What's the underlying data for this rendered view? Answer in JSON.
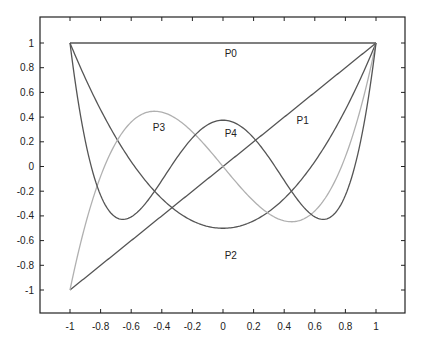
{
  "chart_data": {
    "type": "line",
    "title": "",
    "xlabel": "",
    "ylabel": "",
    "xlim": [
      -1.2,
      1.2
    ],
    "ylim": [
      -1.2,
      1.2
    ],
    "grid": false,
    "legend": "none (curves labeled inline)",
    "x_ticks": [
      "-1",
      "-0.8",
      "-0.6",
      "-0.4",
      "-0.2",
      "0",
      "0.2",
      "0.4",
      "0.6",
      "0.8",
      "1"
    ],
    "y_ticks": [
      "1",
      "0.8",
      "0.6",
      "0.4",
      "0.2",
      "0",
      "-0.2",
      "-0.4",
      "-0.6",
      "-0.8",
      "-1"
    ],
    "x": [
      -1,
      -0.9,
      -0.8,
      -0.7,
      -0.6,
      -0.5,
      -0.4,
      -0.3,
      -0.2,
      -0.1,
      0,
      0.1,
      0.2,
      0.3,
      0.4,
      0.5,
      0.6,
      0.7,
      0.8,
      0.9,
      1
    ],
    "series": [
      {
        "name": "P0",
        "color": "#555555",
        "values": [
          1,
          1,
          1,
          1,
          1,
          1,
          1,
          1,
          1,
          1,
          1,
          1,
          1,
          1,
          1,
          1,
          1,
          1,
          1,
          1,
          1
        ]
      },
      {
        "name": "P1",
        "color": "#555555",
        "values": [
          -1,
          -0.9,
          -0.8,
          -0.7,
          -0.6,
          -0.5,
          -0.4,
          -0.3,
          -0.2,
          -0.1,
          0,
          0.1,
          0.2,
          0.3,
          0.4,
          0.5,
          0.6,
          0.7,
          0.8,
          0.9,
          1
        ]
      },
      {
        "name": "P2",
        "color": "#555555",
        "values": [
          1,
          0.715,
          0.46,
          0.235,
          0.04,
          -0.125,
          -0.26,
          -0.365,
          -0.44,
          -0.485,
          -0.5,
          -0.485,
          -0.44,
          -0.365,
          -0.26,
          -0.125,
          0.04,
          0.235,
          0.46,
          0.715,
          1
        ]
      },
      {
        "name": "P3",
        "color": "#b0b0b0",
        "values": [
          -1,
          -0.4725,
          -0.08,
          0.1925,
          0.36,
          0.4375,
          0.44,
          0.3825,
          0.28,
          0.1475,
          0,
          -0.1475,
          -0.28,
          -0.3825,
          -0.44,
          -0.4375,
          -0.36,
          -0.1925,
          0.08,
          0.4725,
          1
        ]
      },
      {
        "name": "P4",
        "color": "#555555",
        "values": [
          1,
          0.2079,
          -0.233,
          -0.4121,
          -0.408,
          -0.2891,
          -0.113,
          0.0729,
          0.232,
          0.3379,
          0.375,
          0.3379,
          0.232,
          0.0729,
          -0.113,
          -0.2891,
          -0.408,
          -0.4121,
          -0.233,
          0.2079,
          1
        ]
      }
    ],
    "annotations": [
      {
        "text": "P0",
        "x": 0.05,
        "y": 0.92
      },
      {
        "text": "P1",
        "x": 0.52,
        "y": 0.38
      },
      {
        "text": "P2",
        "x": 0.05,
        "y": -0.72
      },
      {
        "text": "P3",
        "x": -0.42,
        "y": 0.32
      },
      {
        "text": "P4",
        "x": 0.05,
        "y": 0.27
      }
    ]
  },
  "labels": {
    "p0": "P0",
    "p1": "P1",
    "p2": "P2",
    "p3": "P3",
    "p4": "P4"
  },
  "axis": {
    "x": [
      "-1",
      "-0.8",
      "-0.6",
      "-0.4",
      "-0.2",
      "0",
      "0.2",
      "0.4",
      "0.6",
      "0.8",
      "1"
    ],
    "y": [
      "1",
      "0.8",
      "0.6",
      "0.4",
      "0.2",
      "0",
      "-0.2",
      "-0.4",
      "-0.6",
      "-0.8",
      "-1"
    ]
  }
}
